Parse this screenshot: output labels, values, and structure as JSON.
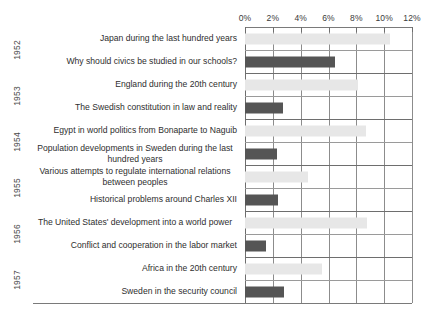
{
  "chart_data": {
    "type": "bar",
    "orientation": "horizontal",
    "title": "",
    "xlabel": "",
    "ylabel": "",
    "xlim": [
      0,
      12
    ],
    "grid": true,
    "legend": "none",
    "x_ticks": [
      "0%",
      "2%",
      "4%",
      "6%",
      "8%",
      "10%",
      "12%"
    ],
    "x_tick_values": [
      0,
      2,
      4,
      6,
      8,
      10,
      12
    ],
    "series": [
      {
        "name": "light",
        "color": "#e7e7e7"
      },
      {
        "name": "dark",
        "color": "#555555"
      }
    ],
    "group_label_name": "year",
    "groups": [
      {
        "year": "1952",
        "rows": [
          0,
          1
        ]
      },
      {
        "year": "1953",
        "rows": [
          2,
          3
        ]
      },
      {
        "year": "1954",
        "rows": [
          4,
          5
        ]
      },
      {
        "year": "1955",
        "rows": [
          6,
          7
        ]
      },
      {
        "year": "1956",
        "rows": [
          8,
          9
        ]
      },
      {
        "year": "1957",
        "rows": [
          10,
          11
        ]
      }
    ],
    "categories": [
      "Japan during the last hundred years",
      "Why should civics be studied in our schools?",
      "England during the 20th century",
      "The Swedish constitution in law and reality",
      "Egypt in world politics from Bonaparte to Naguib",
      "Population developments in Sweden during the last hundred years",
      "Various attempts to regulate international relations between peoples",
      "Historical problems around Charles XII",
      "The United States' development into a world power",
      "Conflict and cooperation in the labor market",
      "Africa in the 20th century",
      "Sweden in the security council"
    ],
    "values": [
      10.4,
      6.5,
      8.1,
      2.7,
      8.7,
      2.3,
      4.5,
      2.4,
      8.8,
      1.5,
      5.5,
      2.8
    ],
    "value_series": [
      "light",
      "dark",
      "light",
      "dark",
      "light",
      "dark",
      "light",
      "dark",
      "light",
      "dark",
      "light",
      "dark"
    ]
  }
}
